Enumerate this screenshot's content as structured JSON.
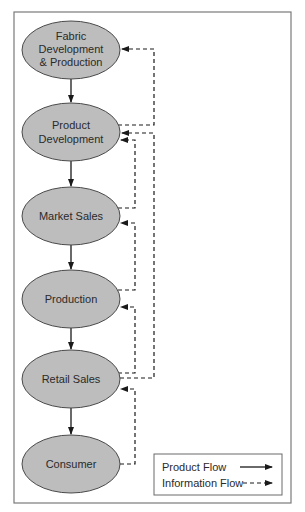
{
  "diagram": {
    "title": "",
    "nodes": [
      {
        "id": "fabric",
        "lines": [
          "Fabric",
          "Development",
          "& Production"
        ]
      },
      {
        "id": "product-dev",
        "lines": [
          "Product",
          "Development"
        ]
      },
      {
        "id": "market-sales",
        "lines": [
          "Market Sales"
        ]
      },
      {
        "id": "production",
        "lines": [
          "Production"
        ]
      },
      {
        "id": "retail-sales",
        "lines": [
          "Retail Sales"
        ]
      },
      {
        "id": "consumer",
        "lines": [
          "Consumer"
        ]
      }
    ],
    "product_flow": [
      {
        "from": "Fabric Development & Production",
        "to": "Product Development"
      },
      {
        "from": "Product Development",
        "to": "Market Sales"
      },
      {
        "from": "Market Sales",
        "to": "Production"
      },
      {
        "from": "Production",
        "to": "Retail Sales"
      },
      {
        "from": "Retail Sales",
        "to": "Consumer"
      }
    ],
    "information_flow": [
      {
        "from": "Product Development",
        "to": "Fabric Development & Production"
      },
      {
        "from": "Retail Sales",
        "to": "Product Development"
      },
      {
        "from": "Market Sales",
        "to": "Product Development"
      },
      {
        "from": "Production",
        "to": "Market Sales"
      },
      {
        "from": "Retail Sales",
        "to": "Production"
      },
      {
        "from": "Consumer",
        "to": "Retail Sales"
      }
    ],
    "legend": {
      "product_flow_label": "Product Flow",
      "information_flow_label": "Information Flow"
    },
    "colors": {
      "node_fill": "#bdbdbd",
      "node_stroke": "#4a4a4a",
      "line": "#1a1a1a",
      "frame": "#7a7a7a"
    }
  }
}
